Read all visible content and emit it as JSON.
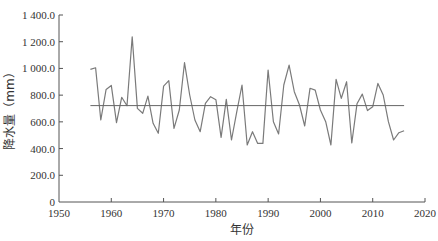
{
  "chart_data": {
    "type": "line",
    "title": "",
    "xlabel": "年份",
    "ylabel": "降水量（mm）",
    "xlim": [
      1950,
      2020
    ],
    "ylim": [
      0,
      1400
    ],
    "x_ticks": [
      1950,
      1960,
      1970,
      1980,
      1990,
      2000,
      2010,
      2020
    ],
    "y_ticks": [
      0,
      200,
      400,
      600,
      800,
      1000,
      1200,
      1400
    ],
    "y_tick_labels": [
      "0",
      "200.0",
      "400.0",
      "600.0",
      "800.0",
      "1 000.0",
      "1 200.0",
      "1 400.0"
    ],
    "x_tick_labels": [
      "1950",
      "1960",
      "1970",
      "1980",
      "1990",
      "2000",
      "2010",
      "2020"
    ],
    "grid": false,
    "legend": null,
    "series": [
      {
        "name": "年降水量",
        "color": "#7a7a7a",
        "x": [
          1956,
          1957,
          1958,
          1959,
          1960,
          1961,
          1962,
          1963,
          1964,
          1965,
          1966,
          1967,
          1968,
          1969,
          1970,
          1971,
          1972,
          1973,
          1974,
          1975,
          1976,
          1977,
          1978,
          1979,
          1980,
          1981,
          1982,
          1983,
          1984,
          1985,
          1986,
          1987,
          1988,
          1989,
          1990,
          1991,
          1992,
          1993,
          1994,
          1995,
          1996,
          1997,
          1998,
          1999,
          2000,
          2001,
          2002,
          2003,
          2004,
          2005,
          2006,
          2007,
          2008,
          2009,
          2010,
          2011,
          2012,
          2013,
          2014,
          2015,
          2016
        ],
        "values": [
          993,
          1005,
          614,
          843,
          873,
          594,
          784,
          721,
          1237,
          701,
          664,
          793,
          589,
          514,
          868,
          908,
          551,
          689,
          1043,
          801,
          614,
          526,
          739,
          788,
          766,
          484,
          769,
          464,
          676,
          876,
          427,
          526,
          439,
          439,
          988,
          601,
          509,
          876,
          1025,
          826,
          726,
          569,
          851,
          838,
          689,
          601,
          427,
          918,
          776,
          901,
          442,
          735,
          808,
          684,
          713,
          888,
          801,
          601,
          464,
          519,
          534
        ]
      },
      {
        "name": "多年平均",
        "color": "#666666",
        "x": [
          1956,
          2016
        ],
        "values": [
          722,
          722
        ]
      }
    ]
  },
  "labels": {
    "xlabel": "年份",
    "ylabel": "降水量（mm）"
  }
}
